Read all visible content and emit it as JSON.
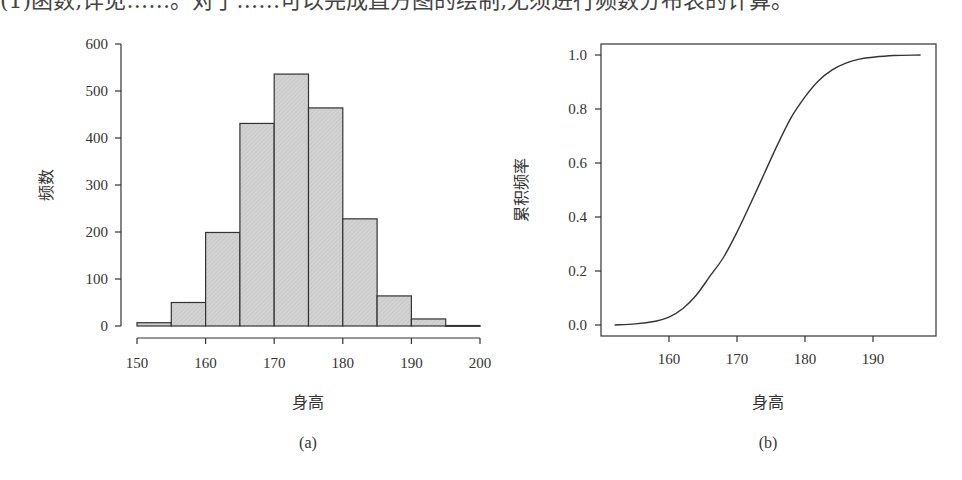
{
  "page": {
    "top_text_clipped": "(1)函数,详见……。对于……可以完成直方图的绘制,无须进行频数分布表的计算。"
  },
  "colors": {
    "bar_fill": "#d3d3d3",
    "bar_stroke": "#333333",
    "line": "#333333",
    "axis": "#333333"
  },
  "chart_data": [
    {
      "type": "bar",
      "subtype": "histogram",
      "caption": "(a)",
      "title": "",
      "xlabel": "身高",
      "ylabel": "频数",
      "bins": [
        [
          150,
          155
        ],
        [
          155,
          160
        ],
        [
          160,
          165
        ],
        [
          165,
          170
        ],
        [
          170,
          175
        ],
        [
          175,
          180
        ],
        [
          180,
          185
        ],
        [
          185,
          190
        ],
        [
          190,
          195
        ],
        [
          195,
          200
        ]
      ],
      "categories": [
        "150-155",
        "155-160",
        "160-165",
        "165-170",
        "170-175",
        "175-180",
        "180-185",
        "185-190",
        "190-195",
        "195-200"
      ],
      "values": [
        7,
        50,
        199,
        431,
        536,
        464,
        228,
        64,
        15,
        1
      ],
      "xticks": [
        150,
        160,
        170,
        180,
        190,
        200
      ],
      "yticks": [
        0,
        100,
        200,
        300,
        400,
        500,
        600
      ],
      "xlim": [
        150,
        200
      ],
      "ylim": [
        0,
        600
      ],
      "grid": false,
      "legend": null
    },
    {
      "type": "line",
      "subtype": "cumulative-frequency",
      "caption": "(b)",
      "title": "",
      "xlabel": "身高",
      "ylabel": "累积频率",
      "x": [
        152,
        155,
        158,
        160,
        162,
        164,
        166,
        168,
        170,
        172,
        174,
        176,
        178,
        180,
        182,
        184,
        186,
        188,
        190,
        193,
        197
      ],
      "y": [
        0.0,
        0.004,
        0.014,
        0.029,
        0.06,
        0.11,
        0.18,
        0.25,
        0.344,
        0.45,
        0.56,
        0.67,
        0.77,
        0.845,
        0.905,
        0.945,
        0.97,
        0.985,
        0.992,
        0.998,
        1.0
      ],
      "xticks": [
        160,
        170,
        180,
        190
      ],
      "yticks": [
        0.0,
        0.2,
        0.4,
        0.6,
        0.8,
        1.0
      ],
      "ytick_labels": [
        "0.0",
        "0.2",
        "0.4",
        "0.6",
        "0.8",
        "1.0"
      ],
      "xlim": [
        150.5,
        199
      ],
      "ylim": [
        -0.04,
        1.04
      ],
      "grid": false,
      "legend": null,
      "boxed": true
    }
  ]
}
